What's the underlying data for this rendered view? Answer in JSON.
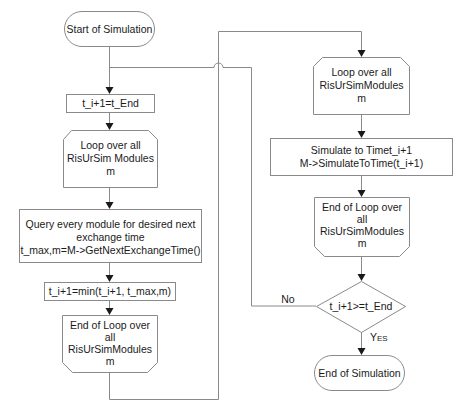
{
  "diagram": {
    "type": "flowchart",
    "nodes": {
      "start": {
        "kind": "terminator",
        "label": "Start of Simulation"
      },
      "set_tend": {
        "kind": "process",
        "label": "t_i+1=t_End"
      },
      "loop1_start": {
        "kind": "loop-start",
        "lines": [
          "Loop over all",
          "RisUrSim Modules",
          "m"
        ]
      },
      "query": {
        "kind": "process",
        "lines": [
          "Query every module for desired next",
          "exchange time",
          "t_max,m=M->GetNextExchangeTime()"
        ]
      },
      "min": {
        "kind": "process",
        "label": "t_i+1=min(t_i+1, t_max,m)"
      },
      "loop1_end": {
        "kind": "loop-end",
        "lines": [
          "End of Loop over",
          "all",
          "RisUrSimModules",
          "m"
        ]
      },
      "loop2_start": {
        "kind": "loop-start",
        "lines": [
          "Loop over all",
          "RisUrSimModules",
          "m"
        ]
      },
      "simulate": {
        "kind": "process",
        "lines": [
          "Simulate to Timet_i+1",
          "M->SimulateToTime(t_i+1)"
        ]
      },
      "loop2_end": {
        "kind": "loop-end",
        "lines": [
          "End of Loop over",
          "all",
          "RisUrSimModules",
          "m"
        ]
      },
      "decision": {
        "kind": "decision",
        "label": "t_i+1>=t_End"
      },
      "end": {
        "kind": "terminator",
        "label": "End of Simulation"
      }
    },
    "edge_labels": {
      "no": "No",
      "yes_initial": "Y",
      "yes_rest": "ES"
    },
    "edges": [
      {
        "from": "start",
        "to": "set_tend"
      },
      {
        "from": "set_tend",
        "to": "loop1_start"
      },
      {
        "from": "loop1_start",
        "to": "query"
      },
      {
        "from": "query",
        "to": "min"
      },
      {
        "from": "min",
        "to": "loop1_end"
      },
      {
        "from": "loop1_end",
        "to": "loop2_start"
      },
      {
        "from": "loop2_start",
        "to": "simulate"
      },
      {
        "from": "simulate",
        "to": "loop2_end"
      },
      {
        "from": "loop2_end",
        "to": "decision"
      },
      {
        "from": "decision",
        "to": "set_tend",
        "label": "No"
      },
      {
        "from": "decision",
        "to": "end",
        "label": "Yes"
      }
    ]
  }
}
